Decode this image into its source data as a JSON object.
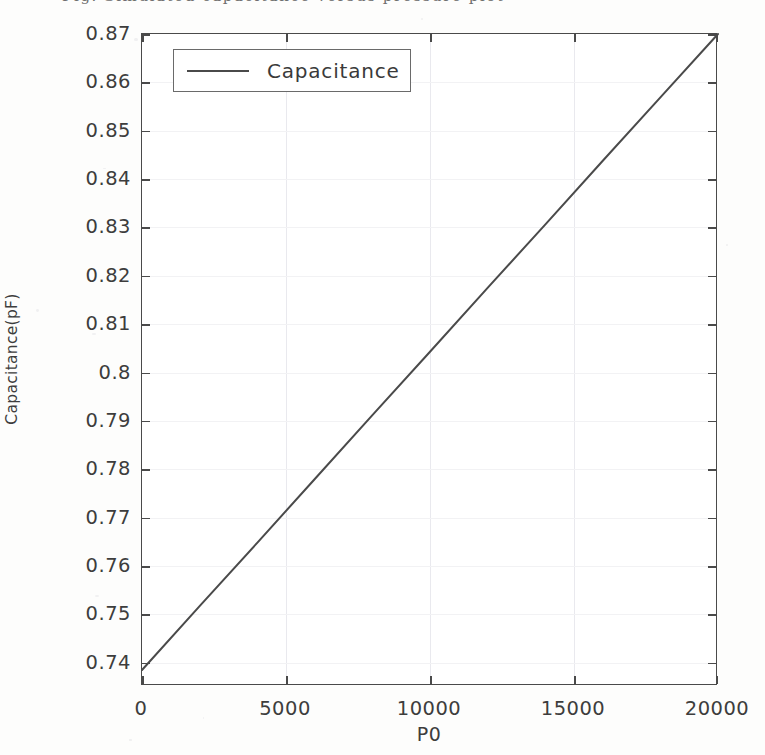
{
  "caption_fragment": "Fig. Simulated capacitance versus pressure plot",
  "chart_data": {
    "type": "line",
    "title": "",
    "xlabel": "P0",
    "ylabel": "Capacitance(pF)",
    "xlim": [
      0,
      20000
    ],
    "ylim": [
      0.7352,
      0.87
    ],
    "grid": true,
    "legend_position": "upper-left",
    "xticks": [
      0,
      5000,
      10000,
      15000,
      20000
    ],
    "xtick_labels": [
      "0",
      "5000",
      "10000",
      "15000",
      "20000"
    ],
    "yticks": [
      0.74,
      0.75,
      0.76,
      0.77,
      0.78,
      0.79,
      0.8,
      0.81,
      0.82,
      0.83,
      0.84,
      0.85,
      0.86,
      0.87
    ],
    "ytick_labels": [
      "0.74",
      "0.75",
      "0.76",
      "0.77",
      "0.78",
      "0.79",
      "0.8",
      "0.81",
      "0.82",
      "0.83",
      "0.84",
      "0.85",
      "0.86",
      "0.87"
    ],
    "series": [
      {
        "name": "Capacitance",
        "color": "#4a4a4a",
        "x": [
          0,
          2000,
          4000,
          6000,
          8000,
          10000,
          12000,
          14000,
          16000,
          18000,
          20000
        ],
        "values": [
          0.7385,
          0.7517,
          0.7648,
          0.778,
          0.7912,
          0.8043,
          0.8175,
          0.8306,
          0.8438,
          0.8569,
          0.87
        ]
      }
    ]
  },
  "legend": {
    "entries": [
      {
        "label": "Capacitance",
        "color": "#4a4a4a"
      }
    ]
  }
}
